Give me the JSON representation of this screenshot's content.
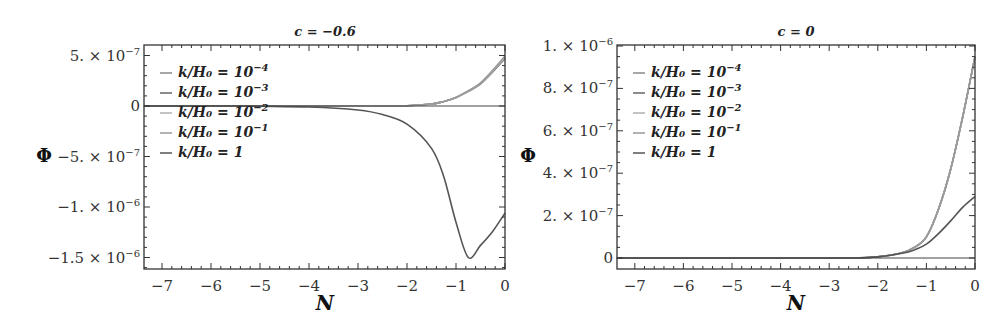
{
  "chart_data": [
    {
      "type": "line",
      "title": "c = −0.6",
      "xlabel": "N",
      "ylabel": "Φ",
      "xlim": [
        -7.37,
        0
      ],
      "ylim": [
        -1.6e-06,
        6e-07
      ],
      "grid": false,
      "legend_position": "upper-left inside",
      "x_ticks": [
        "-7",
        "-6",
        "-5",
        "-4",
        "-3",
        "-2",
        "-1",
        "0"
      ],
      "y_ticks": [
        "5.×10^-7",
        "0",
        "-5.×10^-7",
        "-1.×10^-6",
        "-1.5×10^-6"
      ],
      "x": [
        -7.37,
        -6,
        -5,
        -4,
        -3,
        -2.5,
        -2,
        -1.5,
        -1.25,
        -1,
        -0.75,
        -0.5,
        -0.25,
        0
      ],
      "series": [
        {
          "name": "k/H0 = 10^-4",
          "color": "#8a8a8a",
          "values": [
            0,
            0,
            0,
            0,
            0,
            5e-10,
            2e-09,
            2e-08,
            4.5e-08,
            8.5e-08,
            1.45e-07,
            2.2e-07,
            3.4e-07,
            4.7e-07
          ]
        },
        {
          "name": "k/H0 = 10^-3",
          "color": "#666666",
          "values": [
            0,
            0,
            0,
            0,
            0,
            5e-10,
            2e-09,
            2e-08,
            4.5e-08,
            8.5e-08,
            1.45e-07,
            2.2e-07,
            3.4e-07,
            4.75e-07
          ]
        },
        {
          "name": "k/H0 = 10^-2",
          "color": "#b0b0b0",
          "values": [
            0,
            0,
            0,
            0,
            0,
            5e-10,
            2e-09,
            2e-08,
            4.5e-08,
            8.5e-08,
            1.45e-07,
            2.25e-07,
            3.45e-07,
            4.8e-07
          ]
        },
        {
          "name": "k/H0 = 10^-1",
          "color": "#9a9a9a",
          "values": [
            0,
            0,
            0,
            0,
            0,
            5e-10,
            2e-09,
            2e-08,
            4.5e-08,
            8.5e-08,
            1.5e-07,
            2.3e-07,
            3.55e-07,
            4.95e-07
          ]
        },
        {
          "name": "k/H0 = 1",
          "color": "#555555",
          "values": [
            0,
            0,
            -2e-09,
            -1e-08,
            -4e-08,
            -8.5e-08,
            -1.8e-07,
            -4.2e-07,
            -7e-07,
            -1.15e-06,
            -1.5e-06,
            -1.38e-06,
            -1.24e-06,
            -1.06e-06
          ]
        }
      ]
    },
    {
      "type": "line",
      "title": "c = 0",
      "xlabel": "N",
      "ylabel": "Φ",
      "xlim": [
        -7.37,
        0
      ],
      "ylim": [
        -5.5e-08,
        1e-06
      ],
      "grid": false,
      "legend_position": "upper-left inside",
      "x_ticks": [
        "-7",
        "-6",
        "-5",
        "-4",
        "-3",
        "-2",
        "-1",
        "0"
      ],
      "y_ticks": [
        "1.×10^-6",
        "8.×10^-7",
        "6.×10^-7",
        "4.×10^-7",
        "2.×10^-7",
        "0"
      ],
      "x": [
        -7.37,
        -6,
        -5,
        -4,
        -3,
        -2.5,
        -2,
        -1.5,
        -1.25,
        -1,
        -0.75,
        -0.5,
        -0.25,
        0
      ],
      "series": [
        {
          "name": "k/H0 = 10^-4",
          "color": "#8a8a8a",
          "values": [
            0,
            0,
            0,
            0,
            0,
            2e-10,
            6e-09,
            2.5e-08,
            5e-08,
            1e-07,
            2.3e-07,
            4.2e-07,
            6.7e-07,
            9.5e-07
          ]
        },
        {
          "name": "k/H0 = 10^-3",
          "color": "#666666",
          "values": [
            0,
            0,
            0,
            0,
            0,
            2e-10,
            6e-09,
            2.5e-08,
            5e-08,
            1e-07,
            2.3e-07,
            4.2e-07,
            6.7e-07,
            9.5e-07
          ]
        },
        {
          "name": "k/H0 = 10^-2",
          "color": "#b0b0b0",
          "values": [
            0,
            0,
            0,
            0,
            0,
            2e-10,
            6e-09,
            2.5e-08,
            5e-08,
            1e-07,
            2.3e-07,
            4.2e-07,
            6.7e-07,
            9.5e-07
          ]
        },
        {
          "name": "k/H0 = 10^-1",
          "color": "#9a9a9a",
          "values": [
            0,
            0,
            0,
            0,
            0,
            2e-10,
            6e-09,
            2.5e-08,
            5e-08,
            1e-07,
            2.3e-07,
            4.2e-07,
            6.7e-07,
            9.5e-07
          ]
        },
        {
          "name": "k/H0 = 1",
          "color": "#555555",
          "values": [
            0,
            0,
            0,
            0,
            0,
            2e-10,
            5e-09,
            2.2e-08,
            3.8e-08,
            6.5e-08,
            1.15e-07,
            1.75e-07,
            2.4e-07,
            2.9e-07
          ]
        }
      ]
    }
  ],
  "panels": [
    {
      "title": "c = −0.6",
      "xlabel": "N",
      "ylabel": "Φ",
      "x_ticks": [
        "−7",
        "−6",
        "−5",
        "−4",
        "−3",
        "−2",
        "−1",
        "0"
      ],
      "y_ticks": [
        {
          "mant": "5.",
          "exp": "−7"
        },
        {
          "mant": "0",
          "exp": ""
        },
        {
          "mant": "−5.",
          "exp": "−7"
        },
        {
          "mant": "−1.",
          "exp": "−6"
        },
        {
          "mant": "−1.5",
          "exp": "−6"
        }
      ],
      "legend": [
        {
          "base": "k/H₀ = 10",
          "exp": "−4"
        },
        {
          "base": "k/H₀ = 10",
          "exp": "−3"
        },
        {
          "base": "k/H₀ = 10",
          "exp": "−2"
        },
        {
          "base": "k/H₀ = 10",
          "exp": "−1"
        },
        {
          "base": "k/H₀ = 1",
          "exp": ""
        }
      ]
    },
    {
      "title": "c = 0",
      "xlabel": "N",
      "ylabel": "Φ",
      "x_ticks": [
        "−7",
        "−6",
        "−5",
        "−4",
        "−3",
        "−2",
        "−1",
        "0"
      ],
      "y_ticks": [
        {
          "mant": "1.",
          "exp": "−6"
        },
        {
          "mant": "8.",
          "exp": "−7"
        },
        {
          "mant": "6.",
          "exp": "−7"
        },
        {
          "mant": "4.",
          "exp": "−7"
        },
        {
          "mant": "2.",
          "exp": "−7"
        },
        {
          "mant": "0",
          "exp": ""
        }
      ],
      "legend": [
        {
          "base": "k/H₀ = 10",
          "exp": "−4"
        },
        {
          "base": "k/H₀ = 10",
          "exp": "−3"
        },
        {
          "base": "k/H₀ = 10",
          "exp": "−2"
        },
        {
          "base": "k/H₀ = 10",
          "exp": "−1"
        },
        {
          "base": "k/H₀ = 1",
          "exp": ""
        }
      ]
    }
  ],
  "times_sign": "×",
  "ten": "10"
}
